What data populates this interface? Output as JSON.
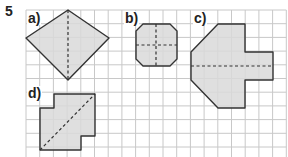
{
  "exercise_number": "5",
  "grid": {
    "x0": 26,
    "y0": 10,
    "step": 13.7,
    "cols": 19,
    "rows": 11,
    "line_color": "#c8c8c8"
  },
  "shape_fill": "#d9d9d9",
  "shape_stroke": "#333333",
  "shapes": [
    {
      "label": "a)",
      "label_pos": [
        27,
        11
      ],
      "points": "68,10 109,38 68,80 26,38",
      "dashed": [
        [
          68,
          10,
          68,
          80
        ]
      ]
    },
    {
      "label": "b)",
      "label_pos": [
        124,
        11
      ],
      "points": "143,24 170,24 177,31 177,59 170,66 143,66 136,59 136,31",
      "dashed": [
        [
          156,
          24,
          156,
          66
        ],
        [
          136,
          45,
          177,
          45
        ]
      ]
    },
    {
      "label": "c)",
      "label_pos": [
        193,
        11
      ],
      "points": "218,24 245,24 245,52 273,52 273,80 245,80 245,108 218,108 191,80 191,52",
      "dashed": [
        [
          191,
          66,
          273,
          66
        ]
      ]
    },
    {
      "label": "d)",
      "label_pos": [
        27,
        86
      ],
      "points": "54,94 95,94 95,136 81,136 81,150 40,150 40,108 54,108",
      "dashed": [
        [
          40,
          150,
          95,
          94
        ]
      ]
    }
  ]
}
